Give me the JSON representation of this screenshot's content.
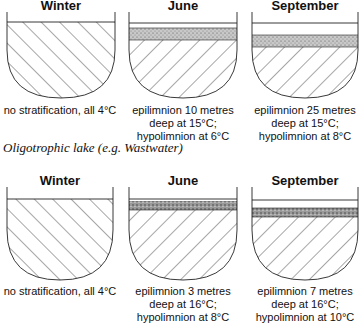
{
  "figure": {
    "row1": {
      "panels": [
        {
          "title": "Winter",
          "caption": [
            "no stratification, all 4°C"
          ]
        },
        {
          "title": "June",
          "caption": [
            "epilimnion 10 metres",
            "deep at 15°C;",
            "hypolimnion at 6°C"
          ]
        },
        {
          "title": "September",
          "caption": [
            "epilimnion 25 metres",
            "deep at 15°C;",
            "hypolimnion at 8°C"
          ]
        }
      ]
    },
    "lake_label": "Oligotrophic lake (e.g. Wastwater)",
    "row2": {
      "panels": [
        {
          "title": "Winter",
          "caption": [
            "no stratification, all 4°C"
          ]
        },
        {
          "title": "June",
          "caption": [
            "epilimnion 3 metres",
            "deep at 16°C;",
            "hypolimnion at 8°C"
          ]
        },
        {
          "title": "September",
          "caption": [
            "epilimnion 7 metres",
            "deep at 16°C;",
            "hypolimnion at 10°C"
          ]
        }
      ]
    }
  }
}
